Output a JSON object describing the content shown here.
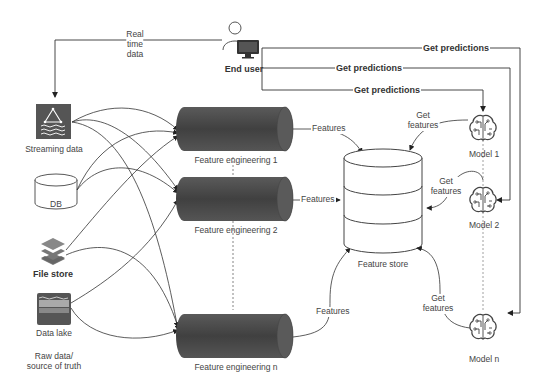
{
  "diagram": {
    "end_user": {
      "label": "End user",
      "icon": "user-computer-icon"
    },
    "real_time_label": [
      "Real",
      "time",
      "data"
    ],
    "sources": [
      {
        "id": "streaming",
        "label": "Streaming data",
        "icon": "streaming-data-icon"
      },
      {
        "id": "db",
        "label": "DB",
        "icon": "database-cylinder-icon"
      },
      {
        "id": "filestore",
        "label": "File store",
        "icon": "layers-icon"
      },
      {
        "id": "datalake",
        "label": "Data lake",
        "icon": "data-lake-icon"
      }
    ],
    "sources_caption": [
      "Raw data/",
      "source of truth"
    ],
    "feature_engineering": [
      {
        "label": "Feature engineering 1"
      },
      {
        "label": "Feature engineering 2"
      },
      {
        "label": "Feature engineering n"
      }
    ],
    "features_edge_label": "Features",
    "feature_store": {
      "label": "Feature store"
    },
    "get_features_label": [
      "Get",
      "features"
    ],
    "get_predictions_label": "Get predictions",
    "models": [
      {
        "label": "Model 1",
        "icon": "brain-circuit-icon"
      },
      {
        "label": "Model 2",
        "icon": "brain-circuit-icon"
      },
      {
        "label": "Model n",
        "icon": "brain-circuit-icon"
      }
    ],
    "colors": {
      "icon_fill": "#555555",
      "cylinder_dark": "#3a3a3a",
      "cylinder_light": "#6a6a6a",
      "line": "#333333"
    }
  }
}
